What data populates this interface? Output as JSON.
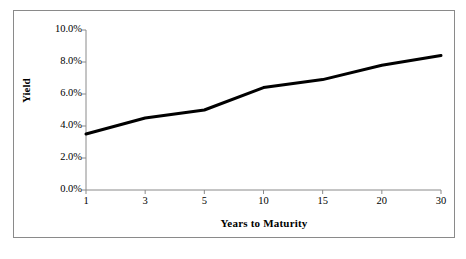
{
  "chart_data": {
    "type": "line",
    "title": "",
    "xlabel": "Years to Maturity",
    "ylabel": "Yield",
    "categories": [
      "1",
      "3",
      "5",
      "10",
      "15",
      "20",
      "30"
    ],
    "x_numeric": [
      1,
      3,
      5,
      10,
      15,
      20,
      30
    ],
    "values": [
      3.5,
      4.5,
      5.0,
      6.4,
      6.9,
      7.8,
      8.4
    ],
    "series": [
      {
        "name": "Yield",
        "values": [
          3.5,
          4.5,
          5.0,
          6.4,
          6.9,
          7.8,
          8.4
        ],
        "color": "#000000",
        "line_width": 3
      }
    ],
    "ylim": [
      0.0,
      10.0
    ],
    "ytick_values": [
      0.0,
      2.0,
      4.0,
      6.0,
      8.0,
      10.0
    ],
    "ytick_labels": [
      "0.0%",
      "2.0%",
      "4.0%",
      "6.0%",
      "8.0%",
      "10.0%"
    ],
    "xtick_labels": [
      "1",
      "3",
      "5",
      "10",
      "15",
      "20",
      "30"
    ],
    "grid": false,
    "legend": null,
    "legend_position": "none",
    "axis_color": "#8a8a8a",
    "plot_background": "#ffffff",
    "frame_border_color": "#8a8a8a"
  },
  "axes": {
    "y_title": "Yield",
    "x_title": "Years to Maturity"
  }
}
